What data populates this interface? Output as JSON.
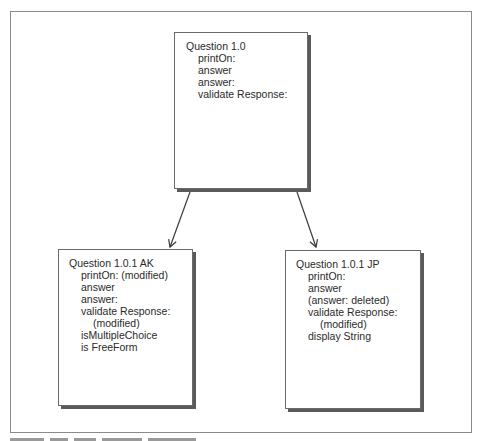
{
  "diagram": {
    "nodes": [
      {
        "id": "top",
        "title": "Question 1.0",
        "lines": [
          {
            "text": "printOn:",
            "sub": false
          },
          {
            "text": "answer",
            "sub": false
          },
          {
            "text": "answer:",
            "sub": false
          },
          {
            "text": "validate Response:",
            "sub": false
          }
        ]
      },
      {
        "id": "left",
        "title": "Question 1.0.1 AK",
        "lines": [
          {
            "text": "printOn: (modified)",
            "sub": false
          },
          {
            "text": "answer",
            "sub": false
          },
          {
            "text": "answer:",
            "sub": false
          },
          {
            "text": "validate Response:",
            "sub": false
          },
          {
            "text": "(modified)",
            "sub": true
          },
          {
            "text": "isMultipleChoice",
            "sub": false
          },
          {
            "text": "is FreeForm",
            "sub": false
          }
        ]
      },
      {
        "id": "right",
        "title": "Question 1.0.1 JP",
        "lines": [
          {
            "text": "printOn:",
            "sub": false
          },
          {
            "text": "answer",
            "sub": false
          },
          {
            "text": "(answer: deleted)",
            "sub": false
          },
          {
            "text": "validate Response:",
            "sub": false
          },
          {
            "text": "(modified)",
            "sub": true
          },
          {
            "text": "display String",
            "sub": false
          }
        ]
      }
    ],
    "edges": [
      {
        "from": "top",
        "to": "left"
      },
      {
        "from": "top",
        "to": "right"
      }
    ],
    "colors": {
      "border": "#6a6a6a",
      "shadow": "#5a5a5a",
      "frame": "#8a8a8a",
      "text": "#2a2a2a",
      "arrow": "#3a3a3a"
    }
  }
}
